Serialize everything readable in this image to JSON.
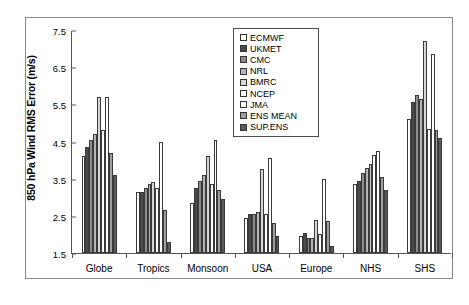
{
  "chart_data": {
    "type": "bar",
    "title": "",
    "xlabel": "",
    "ylabel": "850 hPa Wind RMS Error (m/s)",
    "ylim": [
      1.5,
      7.5
    ],
    "yticks": [
      "1.5",
      "2.5",
      "3.5",
      "4.5",
      "5.5",
      "6.5",
      "7.5"
    ],
    "grid": false,
    "legend_position": "top-center",
    "categories": [
      "Globe",
      "Tropics",
      "Monsoon",
      "USA",
      "Europe",
      "NHS",
      "SHS"
    ],
    "series": [
      {
        "name": "ECMWF",
        "color": "#ffffff",
        "values": [
          4.1,
          3.15,
          2.85,
          2.45,
          1.95,
          3.35,
          5.1
        ]
      },
      {
        "name": "UKMET",
        "color": "#4a4a4a",
        "values": [
          4.35,
          3.15,
          3.25,
          2.55,
          2.05,
          3.45,
          5.55
        ]
      },
      {
        "name": "CMC",
        "color": "#8c8c8c",
        "values": [
          4.55,
          3.25,
          3.45,
          2.55,
          1.9,
          3.65,
          5.75
        ]
      },
      {
        "name": "NRL",
        "color": "#b5b5b5",
        "values": [
          4.7,
          3.35,
          3.6,
          2.6,
          1.9,
          3.8,
          5.65
        ]
      },
      {
        "name": "BMRC",
        "color": "#d6d6d6",
        "values": [
          5.7,
          3.4,
          4.1,
          3.75,
          2.4,
          3.9,
          7.2
        ]
      },
      {
        "name": "NCEP",
        "color": "#ffffff",
        "values": [
          4.8,
          3.25,
          3.35,
          2.55,
          2.0,
          4.15,
          4.85
        ]
      },
      {
        "name": "JMA",
        "color": "#ffffff",
        "values": [
          5.7,
          4.5,
          4.55,
          4.05,
          3.5,
          4.25,
          6.85
        ]
      },
      {
        "name": "ENS MEAN",
        "color": "#9e9e9e",
        "values": [
          4.2,
          2.65,
          3.2,
          2.3,
          2.35,
          3.55,
          4.8
        ]
      },
      {
        "name": "SUP.ENS",
        "color": "#5a5a5a",
        "values": [
          3.6,
          1.8,
          2.95,
          1.95,
          1.7,
          3.2,
          4.6
        ]
      }
    ]
  },
  "legend": {
    "items": [
      {
        "label": "ECMWF"
      },
      {
        "label": "UKMET"
      },
      {
        "label": "CMC"
      },
      {
        "label": "NRL"
      },
      {
        "label": "BMRC"
      },
      {
        "label": "NCEP"
      },
      {
        "label": "JMA"
      },
      {
        "label": "ENS MEAN"
      },
      {
        "label": "SUP.ENS"
      }
    ]
  }
}
